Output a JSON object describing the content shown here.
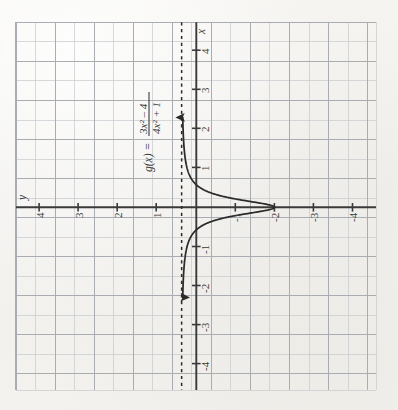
{
  "figure": {
    "function_label": "g(x) =",
    "numerator": "3x² – 4",
    "denominator": "4x² + 1",
    "equation_plain": "g(x) = (3x^2 - 4)/(4x^2 + 1)",
    "orientation_note": "image rotated 90° clockwise",
    "axis_label_x": "x",
    "axis_label_y": "y",
    "paper_color": "#f3f2ef",
    "grid_color": "#b9bcc0",
    "axis_color": "#3a3a3a",
    "curve_color": "#2b2b2b",
    "asymptote_color": "#2b2b2b"
  },
  "chart_data": {
    "type": "line",
    "title": "g(x) = (3x^2 - 4)/(4x^2 + 1)",
    "xlabel": "x",
    "ylabel": "y",
    "xlim": [
      -4.6,
      4.6
    ],
    "ylim": [
      -4.6,
      4.6
    ],
    "grid": true,
    "minor_grid_step": 0.5,
    "tick_step": 1,
    "xticks": [
      -4,
      -3,
      -2,
      -1,
      1,
      2,
      3,
      4
    ],
    "yticks": [
      -4,
      -3,
      -2,
      -1,
      1,
      2,
      3,
      4
    ],
    "xtick_labels": [
      "-4",
      "-3",
      "-2",
      "-1",
      "1",
      "2",
      "3",
      "4"
    ],
    "ytick_labels": [
      "-4",
      "-3",
      "-2",
      "-1",
      "1",
      "2",
      "3",
      "4"
    ],
    "legend": "none",
    "annotations": [
      {
        "text": "g(x) = (3x² – 4)/(4x² + 1)",
        "kind": "equation-label",
        "x": -1.55,
        "y": 2.1
      }
    ],
    "asymptotes": [
      {
        "kind": "horizontal",
        "value": 0.75,
        "style": "dashed",
        "label": "y = 3/4"
      }
    ],
    "features": {
      "y_intercept": -4,
      "x_intercepts": [
        -1.1547,
        1.1547
      ],
      "minimum": {
        "x": 0,
        "y": -4
      },
      "end_behavior": "approaches y = 0.75 as x → ±∞"
    },
    "series": [
      {
        "name": "g(x)",
        "x": [
          -4.5,
          -4.25,
          -4,
          -3.75,
          -3.5,
          -3.25,
          -3,
          -2.75,
          -2.5,
          -2.25,
          -2,
          -1.875,
          -1.75,
          -1.625,
          -1.5,
          -1.375,
          -1.25,
          -1.1547,
          -1.125,
          -1,
          -0.875,
          -0.75,
          -0.625,
          -0.5,
          -0.375,
          -0.25,
          -0.125,
          0,
          0.125,
          0.25,
          0.375,
          0.5,
          0.625,
          0.75,
          0.875,
          1,
          1.125,
          1.1547,
          1.25,
          1.375,
          1.5,
          1.625,
          1.75,
          1.875,
          2,
          2.25,
          2.5,
          2.75,
          3,
          3.25,
          3.5,
          3.75,
          4,
          4.25,
          4.5
        ],
        "y": [
          0.6882,
          0.6791,
          0.6692,
          0.6581,
          0.6457,
          0.6319,
          0.6162,
          0.5983,
          0.5769,
          0.553,
          0.5294,
          0.5105,
          0.4902,
          0.4627,
          0.425,
          0.3775,
          0.3182,
          0.0,
          0.0297,
          -0.2,
          -0.4677,
          -0.7931,
          -1.183,
          -1.625,
          -2.0874,
          -2.5,
          -2.8198,
          -4.0,
          -2.8198,
          -2.5,
          -2.0874,
          -1.625,
          -1.183,
          -0.7931,
          -0.4677,
          -0.2,
          0.0297,
          0.0,
          0.3182,
          0.3775,
          0.425,
          0.4627,
          0.4902,
          0.5105,
          0.5294,
          0.553,
          0.5769,
          0.5983,
          0.6162,
          0.6319,
          0.6457,
          0.6581,
          0.6692,
          0.6791,
          0.6882
        ],
        "style": "solid",
        "arrow_ends": [
          "up",
          "down"
        ],
        "note": "drawn with arrow tips at the extreme ends along the vertical direction of the rotated figure"
      }
    ]
  }
}
